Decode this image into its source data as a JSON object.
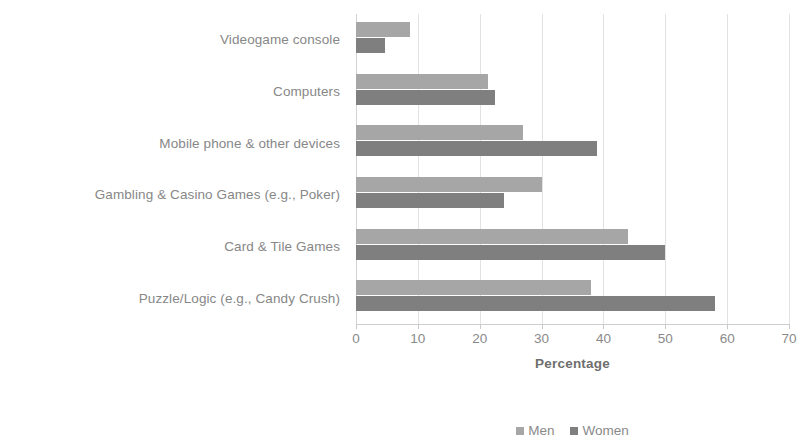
{
  "chart_data": {
    "type": "bar",
    "orientation": "horizontal",
    "title": "",
    "xlabel": "Percentage",
    "ylabel": "",
    "xlim": [
      0,
      70
    ],
    "xticks": [
      0,
      10,
      20,
      30,
      40,
      50,
      60,
      70
    ],
    "grid": true,
    "legend_position": "bottom",
    "categories": [
      "Videogame console",
      "Computers",
      "Mobile phone & other devices",
      "Gambling & Casino Games (e.g., Poker)",
      "Card & Tile Games",
      "Puzzle/Logic (e.g., Candy Crush)"
    ],
    "series": [
      {
        "name": "Men",
        "color": "#a6a6a6",
        "values": [
          8.7,
          21.3,
          27,
          30,
          44,
          38
        ]
      },
      {
        "name": "Women",
        "color": "#7f7f7f",
        "values": [
          4.7,
          22.4,
          39,
          24,
          50,
          58
        ]
      }
    ]
  },
  "axis": {
    "x_title": "Percentage",
    "tick_labels": [
      "0",
      "10",
      "20",
      "30",
      "40",
      "50",
      "60",
      "70"
    ]
  },
  "legend": {
    "items": [
      {
        "label": "Men"
      },
      {
        "label": "Women"
      }
    ]
  }
}
